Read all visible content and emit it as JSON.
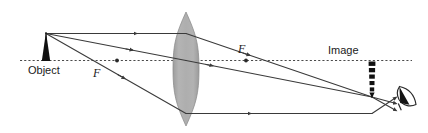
{
  "figure": {
    "type": "optics-ray-diagram",
    "background_color": "#ffffff",
    "width": 428,
    "height": 133
  },
  "labels": {
    "object": "Object",
    "image": "Image",
    "focal_left": "F",
    "focal_right": "F"
  },
  "colors": {
    "ray": "#3a3a3a",
    "axis": "#4a4a4a",
    "object_fill": "#111111",
    "image_fill": "#111111",
    "lens_fill": "#a9a9a9",
    "lens_edge": "#8f8f8f",
    "eye_fill": "#111111",
    "text": "#1a1a1a"
  },
  "geometry": {
    "axis_y": 60,
    "axis_x_start": 20,
    "axis_x_end": 412,
    "lens_center_x": 186,
    "lens_top_y": 12,
    "lens_bottom_y": 126,
    "lens_half_width": 13,
    "object_x": 46,
    "object_top_y": 33,
    "object_base_y": 61,
    "object_half_width": 4,
    "image_x": 372,
    "image_top_y": 61,
    "image_bottom_y": 97,
    "focal_left_x": 117,
    "focal_right_x": 246,
    "eye_x": 404,
    "eye_y": 99
  },
  "elements": {
    "optical_axis": {
      "name": "optical-axis",
      "style": "dotted",
      "description": "horizontal dotted principal axis"
    },
    "lens": {
      "name": "converging-lens",
      "shape": "biconvex",
      "description": "tall gray vertical biconvex lens"
    },
    "object_arrow": {
      "name": "object-arrow",
      "direction": "up",
      "description": "solid black upright arrow at left of lens"
    },
    "image_arrow": {
      "name": "image-arrow",
      "direction": "down",
      "description": "dashed black inverted arrow right of lens below axis"
    },
    "eye": {
      "name": "eye-observer",
      "description": "stylized eye viewing the converging rays"
    }
  },
  "rays": [
    {
      "name": "parallel-ray",
      "description": "travels parallel to axis from object tip, refracts through far focal point",
      "points": "46,33 186,33 372,97"
    },
    {
      "name": "center-ray",
      "description": "passes undeviated through the lens center",
      "points": "46,33 186,60 372,97"
    },
    {
      "name": "focal-ray",
      "description": "passes through near focal point then emerges parallel to axis",
      "points": "46,33 186,113 372,113"
    }
  ],
  "focal_points": [
    {
      "name": "focal-point-left",
      "x": 117,
      "y": 60
    },
    {
      "name": "focal-point-right",
      "x": 246,
      "y": 60
    }
  ]
}
